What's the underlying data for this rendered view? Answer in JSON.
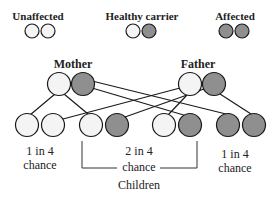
{
  "legend": {
    "unaffected": {
      "label": "Unaffected",
      "circles": [
        "white",
        "white"
      ]
    },
    "carrier": {
      "label": "Healthy carrier",
      "circles": [
        "white",
        "grey"
      ]
    },
    "affected": {
      "label": "Affected",
      "circles": [
        "grey",
        "grey"
      ]
    }
  },
  "parents": {
    "mother": {
      "label": "Mother",
      "alleles": [
        "white",
        "grey"
      ]
    },
    "father": {
      "label": "Father",
      "alleles": [
        "white",
        "grey"
      ]
    }
  },
  "children": {
    "label": "Children",
    "groups": [
      {
        "line1": "1 in 4",
        "line2": "chance",
        "alleles": [
          "white",
          "white"
        ]
      },
      {
        "line1": "2 in 4",
        "line2": "chance",
        "alleles": [
          "white",
          "grey",
          "white",
          "grey"
        ]
      },
      {
        "line1": "1 in 4",
        "line2": "chance",
        "alleles": [
          "grey",
          "grey"
        ]
      }
    ]
  },
  "colors": {
    "white": "#f4f4f4",
    "grey": "#8f8f8f",
    "stroke": "#1a1a1a"
  }
}
